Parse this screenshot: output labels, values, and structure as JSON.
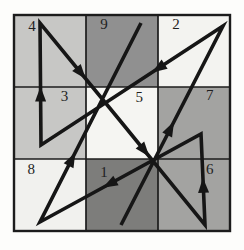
{
  "figure": {
    "magic_square": {
      "rows": 3,
      "cols": 3,
      "values": [
        [
          4,
          9,
          2
        ],
        [
          3,
          5,
          7
        ],
        [
          8,
          1,
          6
        ]
      ],
      "path_order": [
        1,
        2,
        3,
        4,
        5,
        6,
        7,
        8,
        9
      ]
    },
    "colors": {
      "page_background": "#fdfdfb",
      "cell_colors": [
        [
          "#c7c7c5",
          "#909090",
          "#f3f3f0"
        ],
        [
          "#c7c7c5",
          "#f5f5f2",
          "#a3a3a1"
        ],
        [
          "#f1f1ee",
          "#7d7d7b",
          "#a3a3a1"
        ]
      ],
      "grid_line": "#1c1c1c",
      "arrow": "#161616",
      "digit": "#1f1f1f"
    },
    "geometry": {
      "grid_x": 14,
      "grid_y": 15,
      "cell_size": 72,
      "outer_stroke": 2.4,
      "inner_stroke": 1.7,
      "arrow_stroke": 3.6,
      "arrowhead_length": 15,
      "arrowhead_halfwidth": 5.5
    },
    "path": {
      "vertices_px": {
        "1": [
          121,
          225
        ],
        "2": [
          223,
          26
        ],
        "3": [
          41,
          145
        ],
        "4": [
          40,
          23
        ],
        "5": [
          122,
          123
        ],
        "6": [
          205,
          225
        ],
        "7": [
          201,
          134
        ],
        "8": [
          40,
          222
        ],
        "9": [
          141,
          23
        ]
      },
      "arrow_tip_fractions": [
        0.52,
        0.39,
        0.48,
        0.56,
        0.33,
        0.52,
        0.61,
        0.35
      ]
    },
    "label_offsets": {
      "4": [
        0.25,
        0.155
      ],
      "9": [
        0.25,
        0.13
      ],
      "2": [
        0.25,
        0.13
      ],
      "3": [
        0.7,
        0.125
      ],
      "5": [
        0.74,
        0.145
      ],
      "7": [
        0.72,
        0.115
      ],
      "8": [
        0.24,
        0.145
      ],
      "1": [
        0.25,
        0.185
      ],
      "6": [
        0.72,
        0.135
      ]
    }
  }
}
